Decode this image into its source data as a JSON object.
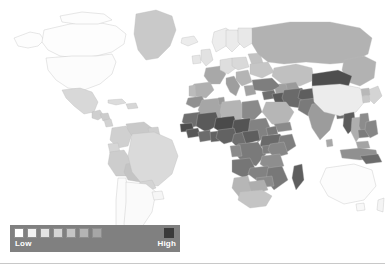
{
  "figure": {
    "type": "choropleth-world-map",
    "background_color": "#ffffff",
    "border_color": "#b9b9b9"
  },
  "legend": {
    "low_label": "Low",
    "high_label": "High",
    "panel_color": "#808080",
    "swatch_colors": [
      "#ffffff",
      "#f2f2f2",
      "#e4e4e4",
      "#d5d5d5",
      "#c4c4c4",
      "#b4b4b4",
      "#a6a6a6"
    ],
    "high_swatch_color": "#3a3a3a"
  },
  "chart_data": {
    "type": "choropleth",
    "title": "",
    "xlabel": "",
    "ylabel": "",
    "projection": "equirectangular",
    "scale_type": "sequential-grayscale",
    "legend_position": "bottom-left",
    "color_scale": [
      "#ffffff",
      "#f2f2f2",
      "#e4e4e4",
      "#d5d5d5",
      "#c4c4c4",
      "#b4b4b4",
      "#a6a6a6",
      "#3a3a3a"
    ],
    "value_range_labels": [
      "Low",
      "High"
    ],
    "regions": [
      {
        "name": "Canada",
        "shade": "#fdfdfd",
        "level": 1
      },
      {
        "name": "United States",
        "shade": "#fcfcfc",
        "level": 1
      },
      {
        "name": "Alaska",
        "shade": "#fdfdfd",
        "level": 1
      },
      {
        "name": "Greenland",
        "shade": "#c9c9c9",
        "level": 4
      },
      {
        "name": "Mexico",
        "shade": "#d8d8d8",
        "level": 3
      },
      {
        "name": "Guatemala",
        "shade": "#cfcfcf",
        "level": 4
      },
      {
        "name": "Honduras",
        "shade": "#cccccc",
        "level": 4
      },
      {
        "name": "Nicaragua",
        "shade": "#d2d2d2",
        "level": 4
      },
      {
        "name": "Cuba",
        "shade": "#dcdcdc",
        "level": 3
      },
      {
        "name": "Colombia",
        "shade": "#d0d0d0",
        "level": 4
      },
      {
        "name": "Venezuela",
        "shade": "#c9c9c9",
        "level": 4
      },
      {
        "name": "Guyana",
        "shade": "#cfcfcf",
        "level": 4
      },
      {
        "name": "Ecuador",
        "shade": "#d6d6d6",
        "level": 3
      },
      {
        "name": "Peru",
        "shade": "#cdcdcd",
        "level": 4
      },
      {
        "name": "Bolivia",
        "shade": "#c4c4c4",
        "level": 5
      },
      {
        "name": "Brazil",
        "shade": "#dadada",
        "level": 3
      },
      {
        "name": "Paraguay",
        "shade": "#d4d4d4",
        "level": 3
      },
      {
        "name": "Chile",
        "shade": "#fbfbfb",
        "level": 1
      },
      {
        "name": "Argentina",
        "shade": "#fafafa",
        "level": 1
      },
      {
        "name": "Uruguay",
        "shade": "#f6f6f6",
        "level": 1
      },
      {
        "name": "Norway",
        "shade": "#ededed",
        "level": 2
      },
      {
        "name": "Sweden",
        "shade": "#ebebeb",
        "level": 2
      },
      {
        "name": "Finland",
        "shade": "#e8e8e8",
        "level": 2
      },
      {
        "name": "United Kingdom",
        "shade": "#e2e2e2",
        "level": 2
      },
      {
        "name": "Ireland",
        "shade": "#e6e6e6",
        "level": 2
      },
      {
        "name": "France",
        "shade": "#a8a8a8",
        "level": 6
      },
      {
        "name": "Spain",
        "shade": "#b0b0b0",
        "level": 6
      },
      {
        "name": "Portugal",
        "shade": "#bbbbbb",
        "level": 5
      },
      {
        "name": "Germany",
        "shade": "#dedede",
        "level": 3
      },
      {
        "name": "Poland",
        "shade": "#d9d9d9",
        "level": 3
      },
      {
        "name": "Italy",
        "shade": "#9e9e9e",
        "level": 6
      },
      {
        "name": "Greece",
        "shade": "#a2a2a2",
        "level": 6
      },
      {
        "name": "Ukraine",
        "shade": "#c6c6c6",
        "level": 4
      },
      {
        "name": "Belarus",
        "shade": "#c2c2c2",
        "level": 5
      },
      {
        "name": "Russia",
        "shade": "#b2b2b2",
        "level": 6
      },
      {
        "name": "Kazakhstan",
        "shade": "#c0c0c0",
        "level": 5
      },
      {
        "name": "Uzbekistan",
        "shade": "#9a9a9a",
        "level": 6
      },
      {
        "name": "Turkmenistan",
        "shade": "#a0a0a0",
        "level": 6
      },
      {
        "name": "Turkey",
        "shade": "#7e7e7e",
        "level": 7
      },
      {
        "name": "Syria",
        "shade": "#6e6e6e",
        "level": 7
      },
      {
        "name": "Iraq",
        "shade": "#5a5a5a",
        "level": 8
      },
      {
        "name": "Iran",
        "shade": "#6a6a6a",
        "level": 7
      },
      {
        "name": "Saudi Arabia",
        "shade": "#b6b6b6",
        "level": 5
      },
      {
        "name": "Yemen",
        "shade": "#8a8a8a",
        "level": 7
      },
      {
        "name": "Afghanistan",
        "shade": "#5e5e5e",
        "level": 8
      },
      {
        "name": "Pakistan",
        "shade": "#7a7a7a",
        "level": 7
      },
      {
        "name": "India",
        "shade": "#9c9c9c",
        "level": 6
      },
      {
        "name": "Nepal",
        "shade": "#8e8e8e",
        "level": 7
      },
      {
        "name": "Bangladesh",
        "shade": "#707070",
        "level": 7
      },
      {
        "name": "Myanmar",
        "shade": "#5c5c5c",
        "level": 8
      },
      {
        "name": "Thailand",
        "shade": "#aeaeae",
        "level": 6
      },
      {
        "name": "Vietnam",
        "shade": "#8c8c8c",
        "level": 7
      },
      {
        "name": "Cambodia",
        "shade": "#7c7c7c",
        "level": 7
      },
      {
        "name": "Malaysia",
        "shade": "#a4a4a4",
        "level": 6
      },
      {
        "name": "Indonesia",
        "shade": "#909090",
        "level": 7
      },
      {
        "name": "Philippines",
        "shade": "#868686",
        "level": 7
      },
      {
        "name": "Papua New Guinea",
        "shade": "#6c6c6c",
        "level": 7
      },
      {
        "name": "China",
        "shade": "#ececec",
        "level": 2
      },
      {
        "name": "Mongolia",
        "shade": "#4e4e4e",
        "level": 8
      },
      {
        "name": "Japan",
        "shade": "#d4d4d4",
        "level": 3
      },
      {
        "name": "South Korea",
        "shade": "#c8c8c8",
        "level": 4
      },
      {
        "name": "North Korea",
        "shade": "#b8b8b8",
        "level": 5
      },
      {
        "name": "Australia",
        "shade": "#fcfcfc",
        "level": 1
      },
      {
        "name": "New Zealand",
        "shade": "#f4f4f4",
        "level": 1
      },
      {
        "name": "Morocco",
        "shade": "#9090 90",
        "level": 7
      },
      {
        "name": "Algeria",
        "shade": "#a6a6a6",
        "level": 6
      },
      {
        "name": "Libya",
        "shade": "#b4b4b4",
        "level": 5
      },
      {
        "name": "Egypt",
        "shade": "#8a8a8a",
        "level": 7
      },
      {
        "name": "Mauritania",
        "shade": "#6e6e6e",
        "level": 7
      },
      {
        "name": "Mali",
        "shade": "#5a5a5a",
        "level": 8
      },
      {
        "name": "Niger",
        "shade": "#4a4a4a",
        "level": 8
      },
      {
        "name": "Chad",
        "shade": "#545454",
        "level": 8
      },
      {
        "name": "Sudan",
        "shade": "#828282",
        "level": 7
      },
      {
        "name": "Ethiopia",
        "shade": "#6a6a6a",
        "level": 7
      },
      {
        "name": "Somalia",
        "shade": "#7e7e7e",
        "level": 7
      },
      {
        "name": "Senegal",
        "shade": "#4c4c4c",
        "level": 8
      },
      {
        "name": "Guinea",
        "shade": "#585858",
        "level": 8
      },
      {
        "name": "Nigeria",
        "shade": "#626262",
        "level": 7
      },
      {
        "name": "Cameroon",
        "shade": "#6e6e6e",
        "level": 7
      },
      {
        "name": "DR Congo",
        "shade": "#7a7a7a",
        "level": 7
      },
      {
        "name": "Kenya",
        "shade": "#868686",
        "level": 7
      },
      {
        "name": "Tanzania",
        "shade": "#8e8e8e",
        "level": 7
      },
      {
        "name": "Angola",
        "shade": "#767676",
        "level": 7
      },
      {
        "name": "Zambia",
        "shade": "#828282",
        "level": 7
      },
      {
        "name": "Mozambique",
        "shade": "#787878",
        "level": 7
      },
      {
        "name": "Madagascar",
        "shade": "#5e5e5e",
        "level": 8
      },
      {
        "name": "Namibia",
        "shade": "#b6b6b6",
        "level": 5
      },
      {
        "name": "Botswana",
        "shade": "#aeaeae",
        "level": 6
      },
      {
        "name": "South Africa",
        "shade": "#c4c4c4",
        "level": 5
      },
      {
        "name": "Zimbabwe",
        "shade": "#8a8a8a",
        "level": 7
      }
    ]
  }
}
